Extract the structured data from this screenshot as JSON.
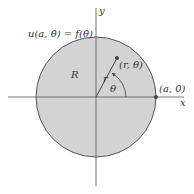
{
  "diagram": {
    "boundary_label": "u(a, θ) = f(θ)",
    "region_label": "R",
    "point_label": "(r, θ)",
    "radius_label": "r",
    "angle_label": "θ",
    "boundary_point_label": "(a, 0)",
    "x_axis_label": "x",
    "y_axis_label": "y",
    "colors": {
      "disk_fill": "#d3d3d3",
      "stroke": "#555555",
      "background": "#ffffff"
    }
  }
}
